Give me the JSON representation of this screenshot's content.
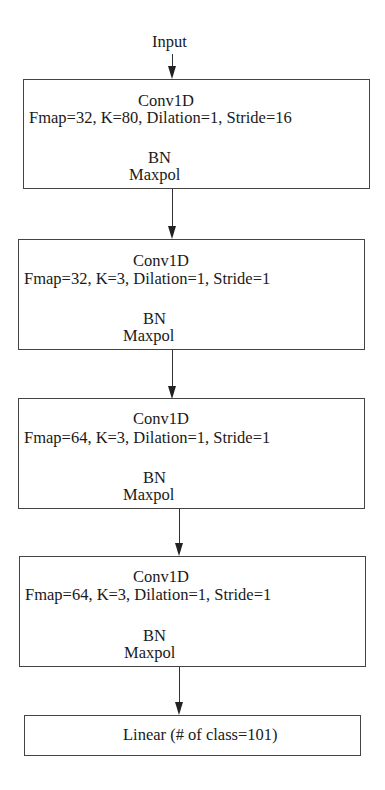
{
  "diagram": {
    "input_label": "Input",
    "blocks": [
      {
        "title": "Conv1D",
        "params": "Fmap=32, K=80, Dilation=1, Stride=16",
        "norm": "BN",
        "pool": "Maxpol"
      },
      {
        "title": "Conv1D",
        "params": "Fmap=32, K=3, Dilation=1, Stride=1",
        "norm": "BN",
        "pool": "Maxpol"
      },
      {
        "title": "Conv1D",
        "params": "Fmap=64, K=3, Dilation=1, Stride=1",
        "norm": "BN",
        "pool": "Maxpol"
      },
      {
        "title": "Conv1D",
        "params": "Fmap=64, K=3, Dilation=1, Stride=1",
        "norm": "BN",
        "pool": "Maxpol"
      }
    ],
    "output_block": {
      "label": "Linear (# of class=101)"
    },
    "colors": {
      "line": "#444444",
      "text": "#1a1a1a",
      "background": "#ffffff"
    }
  }
}
